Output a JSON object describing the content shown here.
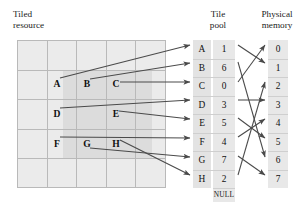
{
  "headers": {
    "tiled_resource": "Tiled\nresource",
    "tile_pool": "Tile\npool",
    "physical_memory": "Physical\nmemory"
  },
  "tiled_resource": {
    "columns": 5,
    "rows": 5,
    "tile_labels": [
      {
        "label": "A",
        "col": 1,
        "row": 1
      },
      {
        "label": "B",
        "col": 2,
        "row": 1
      },
      {
        "label": "C",
        "col": 3,
        "row": 1
      },
      {
        "label": "D",
        "col": 1,
        "row": 2
      },
      {
        "label": "E",
        "col": 3,
        "row": 2
      },
      {
        "label": "F",
        "col": 1,
        "row": 3
      },
      {
        "label": "G",
        "col": 2,
        "row": 3
      },
      {
        "label": "H",
        "col": 3,
        "row": 3
      }
    ],
    "outer_fill": "#ebebeb",
    "inner_fill": "#dcdcdc",
    "gridline_color": "#b9b9b9"
  },
  "tile_pool": {
    "entries": [
      {
        "slot": "A",
        "value": "1"
      },
      {
        "slot": "B",
        "value": "6"
      },
      {
        "slot": "C",
        "value": "0"
      },
      {
        "slot": "D",
        "value": "3"
      },
      {
        "slot": "E",
        "value": "5"
      },
      {
        "slot": "F",
        "value": "4"
      },
      {
        "slot": "G",
        "value": "7"
      },
      {
        "slot": "H",
        "value": "2"
      }
    ],
    "null_entry": "NULL",
    "fill": "#e3e3e3"
  },
  "physical_memory": {
    "pages": [
      "0",
      "1",
      "2",
      "3",
      "4",
      "5",
      "6",
      "7"
    ],
    "fill": "#e8e8e8"
  },
  "mappings": {
    "resource_to_pool": [
      {
        "from": "A",
        "to": "A"
      },
      {
        "from": "B",
        "to": "B"
      },
      {
        "from": "C",
        "to": "C"
      },
      {
        "from": "D",
        "to": "D"
      },
      {
        "from": "E",
        "to": "E"
      },
      {
        "from": "F",
        "to": "F"
      },
      {
        "from": "G",
        "to": "G"
      },
      {
        "from": "H",
        "to": "H"
      }
    ],
    "pool_to_memory": [
      {
        "slot": "A",
        "value": "1",
        "page": "1"
      },
      {
        "slot": "B",
        "value": "6",
        "page": "6"
      },
      {
        "slot": "C",
        "value": "0",
        "page": "0"
      },
      {
        "slot": "D",
        "value": "3",
        "page": "3"
      },
      {
        "slot": "E",
        "value": "5",
        "page": "5"
      },
      {
        "slot": "F",
        "value": "4",
        "page": "4"
      },
      {
        "slot": "G",
        "value": "7",
        "page": "7"
      },
      {
        "slot": "H",
        "value": "2",
        "page": "2"
      }
    ],
    "arrow_color": "#4a4a4a"
  }
}
